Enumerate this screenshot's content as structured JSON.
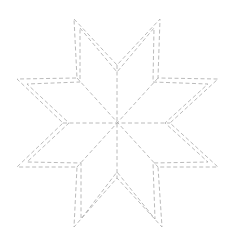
{
  "diagram": {
    "title": "",
    "type": "eight-pointed-star-quilt-pattern",
    "stroke_color": "#a8a8a8",
    "background": "#ffffff",
    "center": [
      117,
      123
    ],
    "outer_outline": [
      [
        74,
        19
      ],
      [
        117,
        65
      ],
      [
        160,
        19
      ],
      [
        158,
        78
      ],
      [
        218,
        79
      ],
      [
        170,
        123
      ],
      [
        218,
        167
      ],
      [
        158,
        167
      ],
      [
        162,
        227
      ],
      [
        117,
        178
      ],
      [
        74,
        227
      ],
      [
        77,
        167
      ],
      [
        17,
        167
      ],
      [
        63,
        123
      ],
      [
        17,
        79
      ],
      [
        77,
        78
      ]
    ],
    "inner_outline": [
      [
        80,
        28
      ],
      [
        117,
        72
      ],
      [
        154,
        28
      ],
      [
        153,
        82
      ],
      [
        208,
        84
      ],
      [
        165,
        123
      ],
      [
        208,
        162
      ],
      [
        153,
        163
      ],
      [
        155,
        219
      ],
      [
        117,
        172
      ],
      [
        81,
        219
      ],
      [
        81,
        163
      ],
      [
        27,
        162
      ],
      [
        69,
        123
      ],
      [
        27,
        84
      ],
      [
        80,
        82
      ]
    ],
    "spokes": [
      [
        [
          117,
          65
        ],
        [
          117,
          178
        ]
      ],
      [
        [
          63,
          123
        ],
        [
          170,
          123
        ]
      ],
      [
        [
          77,
          78
        ],
        [
          158,
          167
        ]
      ],
      [
        [
          158,
          78
        ],
        [
          77,
          167
        ]
      ]
    ]
  }
}
